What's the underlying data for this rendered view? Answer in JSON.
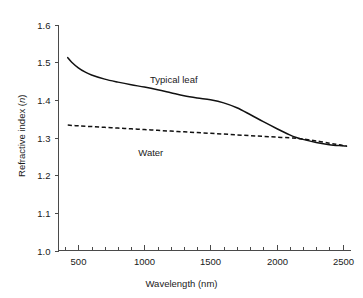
{
  "chart_data": {
    "type": "line",
    "title": "",
    "xlabel": "Wavelength (nm)",
    "ylabel": "Refractive index (n)",
    "ylabel_plain": "Refractive index",
    "ylabel_symbol": "n",
    "xlim": [
      350,
      2560
    ],
    "ylim": [
      1.0,
      1.6
    ],
    "grid": false,
    "legend_position": "inline-annotations",
    "xticks": [
      500,
      1000,
      1500,
      2000,
      2500
    ],
    "xtick_labels": [
      "500",
      "1000",
      "1500",
      "2000",
      "2500"
    ],
    "x_minor_tick_step": 100,
    "yticks": [
      1.0,
      1.1,
      1.2,
      1.3,
      1.4,
      1.5,
      1.6
    ],
    "ytick_labels": [
      "1.0",
      "1.1",
      "1.2",
      "1.3",
      "1.4",
      "1.5",
      "1.6"
    ],
    "series": [
      {
        "name": "Typical leaf",
        "style": "solid",
        "color": "#111111",
        "annotation": "Typical leaf",
        "x": [
          420,
          450,
          500,
          550,
          600,
          700,
          800,
          900,
          1000,
          1100,
          1200,
          1300,
          1400,
          1500,
          1600,
          1700,
          1800,
          1900,
          2000,
          2100,
          2150,
          2200,
          2300,
          2400,
          2500,
          2530
        ],
        "y": [
          1.512,
          1.5,
          1.485,
          1.474,
          1.466,
          1.455,
          1.447,
          1.44,
          1.434,
          1.427,
          1.419,
          1.411,
          1.405,
          1.4,
          1.392,
          1.379,
          1.361,
          1.342,
          1.324,
          1.307,
          1.3,
          1.295,
          1.287,
          1.281,
          1.278,
          1.277
        ]
      },
      {
        "name": "Water",
        "style": "dashed",
        "color": "#111111",
        "annotation": "Water",
        "x": [
          420,
          500,
          600,
          700,
          800,
          900,
          1000,
          1100,
          1200,
          1300,
          1400,
          1500,
          1600,
          1700,
          1800,
          1900,
          2000,
          2100,
          2150,
          2200,
          2300,
          2400,
          2450,
          2500,
          2530
        ],
        "y": [
          1.333,
          1.331,
          1.329,
          1.327,
          1.325,
          1.323,
          1.321,
          1.319,
          1.317,
          1.315,
          1.313,
          1.311,
          1.309,
          1.307,
          1.305,
          1.303,
          1.301,
          1.299,
          1.298,
          1.296,
          1.291,
          1.285,
          1.282,
          1.279,
          1.278
        ]
      }
    ],
    "annotations": [
      {
        "text": "Typical leaf",
        "x": 1270,
        "y": 1.452
      },
      {
        "text": "Water",
        "x": 1370,
        "y": 1.305
      }
    ]
  }
}
